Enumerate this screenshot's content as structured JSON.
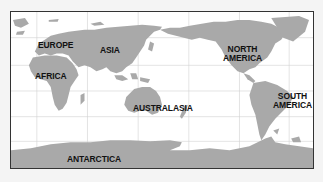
{
  "map": {
    "projection": "Pacific-centered world map",
    "colors": {
      "land": "#a9a9a9",
      "ocean": "#ffffff",
      "grid": "#d2d2d2",
      "border": "#333333",
      "label": "#111111",
      "page_background": "#f4f4f4"
    },
    "labels": {
      "europe": "EUROPE",
      "asia": "ASIA",
      "africa": "AFRICA",
      "north_america": "NORTH\nAMERICA",
      "australasia": "AUSTRALASIA",
      "south_america": "SOUTH\nAMERICA",
      "antarctica": "ANTARCTICA"
    }
  }
}
